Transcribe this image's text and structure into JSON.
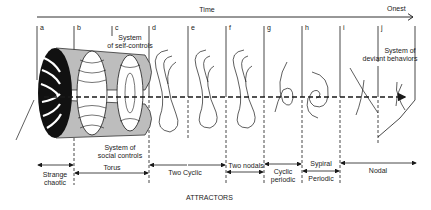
{
  "diagram": {
    "time_axis": {
      "label": "Time",
      "end_label": "Onest"
    },
    "stages": [
      {
        "letter": "a"
      },
      {
        "letter": "b"
      },
      {
        "letter": "c"
      },
      {
        "letter": "d"
      },
      {
        "letter": "e"
      },
      {
        "letter": "f"
      },
      {
        "letter": "g"
      },
      {
        "letter": "h"
      },
      {
        "letter": "i"
      },
      {
        "letter": "j"
      }
    ],
    "annotations": {
      "self_controls": [
        "System",
        "of self-controls"
      ],
      "social_controls": [
        "System of",
        "social controls"
      ],
      "deviant": [
        "System of",
        "deviant behaviors"
      ]
    },
    "ranges": [
      {
        "label": [
          "Strange",
          "chaotic"
        ]
      },
      {
        "label": [
          "Torus"
        ]
      },
      {
        "label": [
          "Two Cyclic"
        ]
      },
      {
        "label": [
          "Two nodals"
        ]
      },
      {
        "label": [
          "Cyclic",
          "periodic"
        ]
      },
      {
        "label": [
          "Sypiral",
          "Periodic"
        ]
      },
      {
        "label": [
          "Nodal"
        ]
      }
    ],
    "caption": "ATTRACTORS",
    "colors": {
      "ink": "#1a1a1a",
      "torus_fill": "#bdbdbd",
      "background": "#ffffff"
    }
  }
}
